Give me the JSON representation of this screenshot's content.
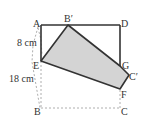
{
  "figure": {
    "type": "geometry-folding-diagram",
    "fill_color": "#d4d4d4",
    "stroke_color": "#333333",
    "dashed_color": "#999999",
    "points": {
      "A": "A",
      "B_prime": "B′",
      "D": "D",
      "E": "E",
      "G": "G",
      "C_prime": "C′",
      "F": "F",
      "B": "B",
      "C": "C"
    },
    "measurements": {
      "AE": "8 cm",
      "AB": "18 cm"
    }
  }
}
